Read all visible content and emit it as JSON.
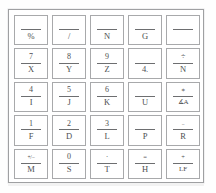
{
  "figure": {
    "panel_border_color": "#9fa0a2",
    "key_border_color": "#a8a9ab",
    "text_color": "#4e4f51",
    "background_color": "#ffffff",
    "rows": 5,
    "columns": 5
  },
  "keys": [
    [
      {
        "name": "key-percent-blank",
        "top": "",
        "bottom": "%",
        "top_size": "normal",
        "bottom_size": "normal"
      },
      {
        "name": "key-slash-blank",
        "top": "",
        "bottom": "/",
        "top_size": "normal",
        "bottom_size": "normal"
      },
      {
        "name": "key-blank-n",
        "top": "",
        "bottom": "N",
        "top_size": "normal",
        "bottom_size": "normal"
      },
      {
        "name": "key-blank-g",
        "top": "",
        "bottom": "G",
        "top_size": "normal",
        "bottom_size": "normal"
      },
      {
        "name": "key-blank-blank",
        "top": "",
        "bottom": "",
        "top_size": "normal",
        "bottom_size": "normal"
      }
    ],
    [
      {
        "name": "key-7-x",
        "top": "7",
        "bottom": "X",
        "top_size": "normal",
        "bottom_size": "normal"
      },
      {
        "name": "key-8-y",
        "top": "8",
        "bottom": "Y",
        "top_size": "normal",
        "bottom_size": "normal"
      },
      {
        "name": "key-9-z",
        "top": "9",
        "bottom": "Z",
        "top_size": "normal",
        "bottom_size": "normal"
      },
      {
        "name": "key-blank-4dot",
        "top": "",
        "bottom": "4.",
        "top_size": "normal",
        "bottom_size": "normal"
      },
      {
        "name": "key-divide-n",
        "top": "÷",
        "bottom": "N",
        "top_size": "normal",
        "bottom_size": "normal"
      }
    ],
    [
      {
        "name": "key-4-i",
        "top": "4",
        "bottom": "I",
        "top_size": "normal",
        "bottom_size": "normal"
      },
      {
        "name": "key-5-j",
        "top": "5",
        "bottom": "J",
        "top_size": "normal",
        "bottom_size": "normal"
      },
      {
        "name": "key-6-k",
        "top": "6",
        "bottom": "K",
        "top_size": "normal",
        "bottom_size": "normal"
      },
      {
        "name": "key-blank-u",
        "top": "",
        "bottom": "U",
        "top_size": "normal",
        "bottom_size": "normal"
      },
      {
        "name": "key-asterisk-angle-a",
        "top": "∗",
        "bottom": "∡A",
        "top_size": "small",
        "bottom_size": "small"
      }
    ],
    [
      {
        "name": "key-1-f",
        "top": "1",
        "bottom": "F",
        "top_size": "normal",
        "bottom_size": "normal"
      },
      {
        "name": "key-2-d",
        "top": "2",
        "bottom": "D",
        "top_size": "normal",
        "bottom_size": "normal"
      },
      {
        "name": "key-3-l",
        "top": "3",
        "bottom": "L",
        "top_size": "normal",
        "bottom_size": "normal"
      },
      {
        "name": "key-blank-p",
        "top": "",
        "bottom": "P",
        "top_size": "normal",
        "bottom_size": "normal"
      },
      {
        "name": "key-minus-r",
        "top": "−",
        "bottom": "R",
        "top_size": "tiny",
        "bottom_size": "normal"
      }
    ],
    [
      {
        "name": "key-plusminus-m",
        "top": "+/−",
        "bottom": "M",
        "top_size": "tiny",
        "bottom_size": "normal"
      },
      {
        "name": "key-0-s",
        "top": "0",
        "bottom": "S",
        "top_size": "normal",
        "bottom_size": "normal"
      },
      {
        "name": "key-decimal-t",
        "top": "·",
        "bottom": "T",
        "top_size": "normal",
        "bottom_size": "normal"
      },
      {
        "name": "key-equals-h",
        "top": "=",
        "bottom": "H",
        "top_size": "small",
        "bottom_size": "normal"
      },
      {
        "name": "key-plus-lf",
        "top": "+",
        "bottom": "LF",
        "top_size": "small",
        "bottom_size": "small"
      }
    ]
  ]
}
